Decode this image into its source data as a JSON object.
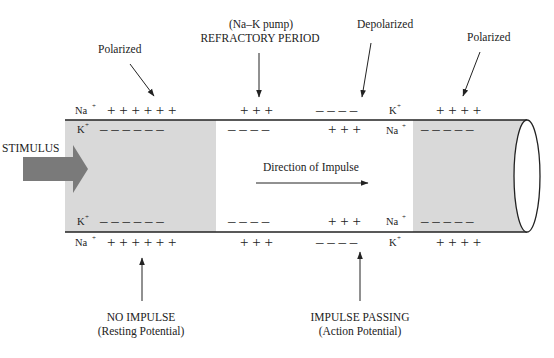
{
  "diagram": {
    "colors": {
      "background": "#ffffff",
      "polarized_shading": "#d9d9d9",
      "stimulus_arrow": "#7a7a7a",
      "lines": "#222222"
    },
    "labels": {
      "polarized_left": "Polarized",
      "refractory_line1": "(Na–K pump)",
      "refractory_line2": "REFRACTORY PERIOD",
      "depolarized": "Depolarized",
      "polarized_right": "Polarized",
      "stimulus": "STIMULUS",
      "direction": "Direction of Impulse",
      "no_impulse_line1": "NO IMPULSE",
      "no_impulse_line2": "(Resting Potential)",
      "impulse_passing_line1": "IMPULSE PASSING",
      "impulse_passing_line2": "(Action Potential)"
    },
    "ions": {
      "na": "Na",
      "k": "K",
      "plus": "+"
    },
    "segments": [
      {
        "name": "resting-segment",
        "state": "Polarized / Resting",
        "outside_top": "+ + + + + +",
        "inside_top": "– – – – – –",
        "inside_bottom": "– – – – – –",
        "outside_bottom": "+ + + + + +"
      },
      {
        "name": "refractory-segment",
        "state": "Refractory period (Na–K pump)",
        "outside_top": "+ + +",
        "inside_top": "– – – –",
        "inside_bottom": "– – – –",
        "outside_bottom": "+ + +"
      },
      {
        "name": "depolarized-segment",
        "state": "Depolarized / Action potential",
        "outside_top": "– – – –",
        "inside_top": "+ + +",
        "inside_bottom": "+ + +",
        "outside_bottom": "– – – –"
      },
      {
        "name": "polarized-right-segment",
        "state": "Polarized",
        "outside_top": "+ + + +",
        "inside_top": "– – – – –",
        "inside_bottom": "– – – – –",
        "outside_bottom": "+ + + +"
      }
    ]
  }
}
